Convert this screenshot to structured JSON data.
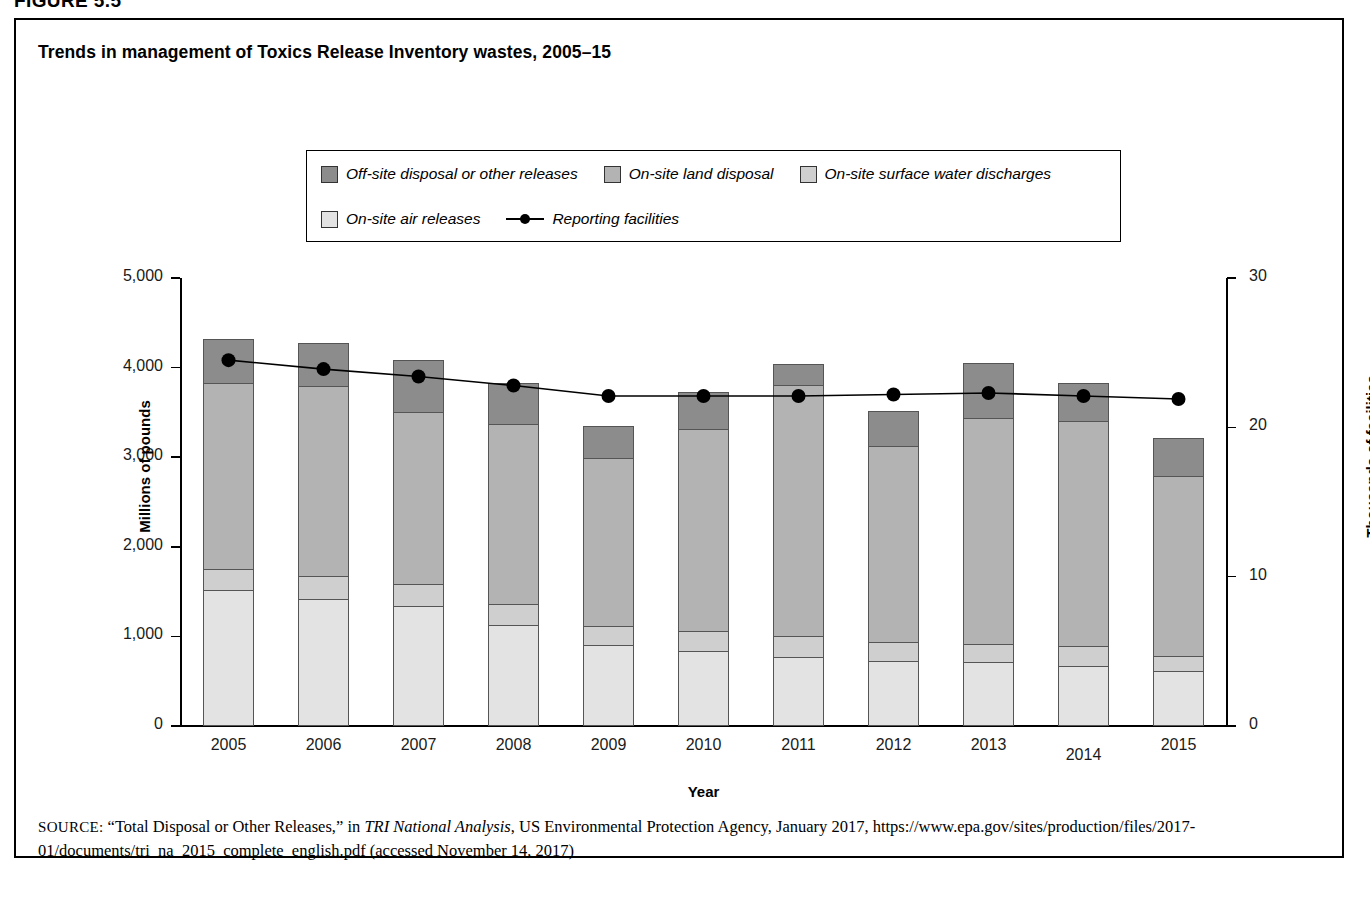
{
  "figure_header": "FIGURE 5.5",
  "chart_title": "Trends in management of Toxics Release Inventory wastes, 2005–15",
  "legend": {
    "items": [
      {
        "label": "Off-site disposal or other releases",
        "color": "#8c8c8c",
        "type": "swatch"
      },
      {
        "label": "On-site land disposal",
        "color": "#b3b3b3",
        "type": "swatch"
      },
      {
        "label": "On-site surface water discharges",
        "color": "#cfcfcf",
        "type": "swatch"
      },
      {
        "label": "On-site air releases",
        "color": "#e3e3e3",
        "type": "swatch"
      },
      {
        "label": "Reporting facilities",
        "color": "#000000",
        "type": "line"
      }
    ]
  },
  "source": {
    "prefix": "SOURCE:",
    "text_1": " “Total Disposal or Other Releases,” in ",
    "italic_1": "TRI National Analysis",
    "text_2": ", US Environmental Protection Agency, January 2017, https://www.epa.gov/sites/production/files/2017-01/documents/tri_na_2015_complete_english.pdf (accessed November 14, 2017)"
  },
  "chart_data": {
    "type": "bar",
    "subtype": "stacked-bar-with-line",
    "title": "Trends in management of Toxics Release Inventory wastes, 2005–15",
    "xlabel": "Year",
    "ylabel": "Millions of pounds",
    "y2label": "Thousands of facilities",
    "categories": [
      "2005",
      "2006",
      "2007",
      "2008",
      "2009",
      "2010",
      "2011",
      "2012",
      "2013",
      "2014",
      "2015"
    ],
    "ylim": [
      0,
      5000
    ],
    "yticks": [
      "0",
      "1,000",
      "2,000",
      "3,000",
      "4,000",
      "5,000"
    ],
    "ytick_values": [
      0,
      1000,
      2000,
      3000,
      4000,
      5000
    ],
    "y2lim": [
      0,
      30
    ],
    "y2ticks": [
      "0",
      "10",
      "20",
      "30"
    ],
    "y2tick_values": [
      0,
      10,
      20,
      30
    ],
    "grid": false,
    "legend_position": "top-center",
    "series": [
      {
        "name": "On-site air releases",
        "color": "#e3e3e3",
        "axis": "left",
        "values": [
          1520,
          1420,
          1340,
          1130,
          900,
          840,
          770,
          730,
          710,
          670,
          610
        ]
      },
      {
        "name": "On-site surface water discharges",
        "color": "#cfcfcf",
        "axis": "left",
        "values": [
          230,
          250,
          250,
          230,
          220,
          220,
          240,
          210,
          210,
          220,
          170
        ]
      },
      {
        "name": "On-site land disposal",
        "color": "#b3b3b3",
        "axis": "left",
        "values": [
          2080,
          2120,
          1920,
          2010,
          1870,
          2260,
          2800,
          2180,
          2520,
          2510,
          2010
        ]
      },
      {
        "name": "Off-site disposal or other releases",
        "color": "#8c8c8c",
        "axis": "left",
        "values": [
          490,
          490,
          580,
          460,
          360,
          410,
          230,
          400,
          610,
          430,
          430
        ]
      },
      {
        "name": "Reporting facilities",
        "color": "#000000",
        "axis": "right",
        "chart": "line",
        "values": [
          24.5,
          23.9,
          23.4,
          22.8,
          22.1,
          22.1,
          22.1,
          22.2,
          22.3,
          22.1,
          21.9
        ]
      }
    ],
    "totals": [
      4320,
      4280,
      4090,
      3830,
      3350,
      3730,
      4040,
      3520,
      4050,
      3830,
      3220
    ]
  }
}
